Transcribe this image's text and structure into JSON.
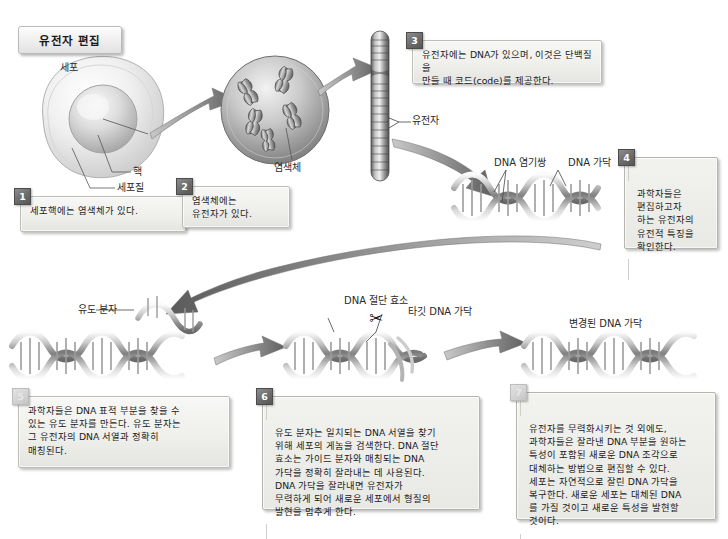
{
  "title": {
    "text": "유전자 편집"
  },
  "labels": {
    "cell": "세포",
    "nucleus": "핵",
    "cytoplasm": "세포질",
    "chromosome": "염색체",
    "gene": "유전자",
    "dna_base_pair": "DNA 염기쌍",
    "dna_strand": "DNA 가닥",
    "guide_molecule": "유도 분자",
    "dna_cutting_enzyme": "DNA 절단 효소",
    "target_dna_strand": "타깃 DNA 가닥",
    "modified_dna_strand": "변경된 DNA 가닥"
  },
  "icons": {
    "scissors": "✂"
  },
  "steps": [
    {
      "number": "1",
      "text": "세포핵에는 염색체가 있다."
    },
    {
      "number": "2",
      "text": "염색체에는\n유전자가 있다."
    },
    {
      "number": "3",
      "text": "유전자에는 DNA가 있으며, 이것은 단백질을\n만들 때 코드(code)를 제공한다."
    },
    {
      "number": "4",
      "text": "과학자들은\n편집하고자\n하는 유전자의\n유전적 특징을\n확인한다."
    },
    {
      "number": "5",
      "text": "과학자들은 DNA 표적 부분을 찾을 수\n있는 유도 분자를 만든다. 유도 분자는\n그 유전자의 DNA 서열과 정확히\n매칭된다."
    },
    {
      "number": "6",
      "text": "유도 분자는 일치되는 DNA 서열을 찾기\n위해 세포의 게놈을 검색한다. DNA 절단\n효소는 가이드 분자와 매칭되는 DNA\n가닥을 정확히 잘라내는 데 사용된다.\nDNA 가닥을 잘라내면 유전자가\n무력하게 되어 새로운 세포에서 형질의\n발현을 멈추게 한다."
    },
    {
      "number": "7",
      "text": "유전자를 무력화시키는 것 외에도,\n과학자들은 잘라낸 DNA 부분을 원하는\n특성이 포함된 새로운 DNA 조각으로\n대체하는 방법으로 편집할 수 있다.\n세포는 자연적으로 잘린 DNA 가닥을\n복구한다. 새로운 세포는 대체된 DNA\n를 가질 것이고 새로운 특성을 발현할\n것이다."
    }
  ],
  "colors": {
    "background": "#ffffff",
    "box_fill": "#efefec",
    "box_border": "#bdbdb8",
    "badge_dark": "#6b6b6b",
    "badge_light": "#d2d2d2",
    "arrow": "#8a8a8a",
    "ink": "#1c1c1c"
  }
}
